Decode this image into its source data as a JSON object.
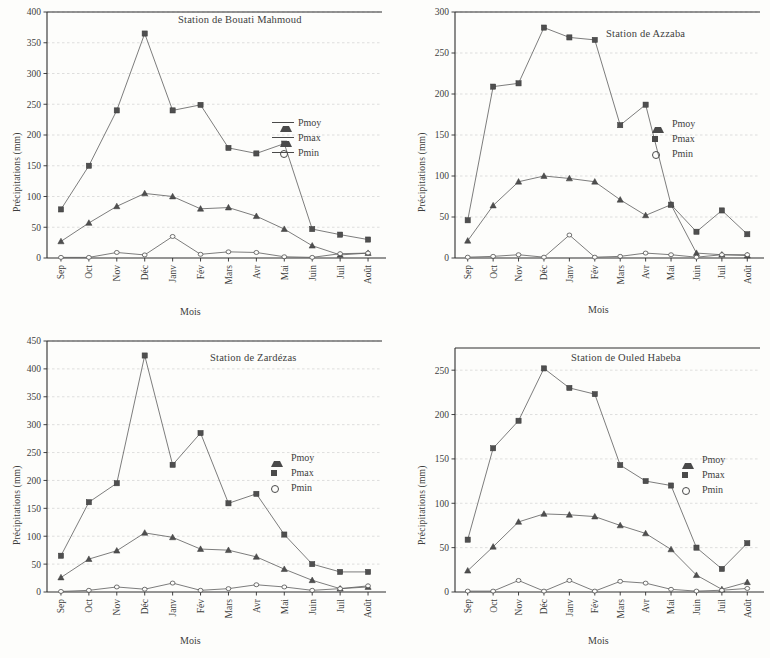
{
  "figure": {
    "background_color": "#fdfdfb",
    "ink_color": "#3d3d3d",
    "grid_color": "#c9c9c9"
  },
  "common": {
    "xlabel": "Mois",
    "ylabel": "Précipitations (mm)",
    "months": [
      "Sep",
      "Oct",
      "Nov",
      "Déc",
      "Janv",
      "Fév",
      "Mars",
      "Avr",
      "Mai",
      "Juin",
      "Juil",
      "Août"
    ],
    "legend": {
      "pmoy": "Pmoy",
      "pmax": "Pmax",
      "pmin": "Pmin"
    }
  },
  "chart_data": [
    {
      "id": "bouati-mahmoud",
      "type": "line",
      "title": "Station de Bouati Mahmoud",
      "xlabel": "Mois",
      "ylabel": "Précipitations (mm)",
      "categories": [
        "Sep",
        "Oct",
        "Nov",
        "Déc",
        "Janv",
        "Fév",
        "Mars",
        "Avr",
        "Mai",
        "Juin",
        "Juil",
        "Août"
      ],
      "ylim": [
        0,
        400
      ],
      "yticks": [
        0,
        50,
        100,
        150,
        200,
        250,
        300,
        350,
        400
      ],
      "grid": true,
      "legend_position": "right-middle",
      "series": [
        {
          "name": "Pmoy",
          "marker": "triangle",
          "values": [
            27,
            57,
            84,
            105,
            100,
            80,
            82,
            68,
            47,
            20,
            5,
            8
          ]
        },
        {
          "name": "Pmax",
          "marker": "square",
          "values": [
            79,
            150,
            240,
            365,
            240,
            249,
            179,
            170,
            186,
            47,
            38,
            30
          ]
        },
        {
          "name": "Pmin",
          "marker": "circle",
          "values": [
            1,
            1,
            9,
            5,
            35,
            6,
            10,
            9,
            2,
            1,
            7,
            8
          ]
        }
      ]
    },
    {
      "id": "azzaba",
      "type": "line",
      "title": "Station de Azzaba",
      "xlabel": "Mois",
      "ylabel": "Précipitations (mm)",
      "categories": [
        "Sep",
        "Oct",
        "Nov",
        "Déc",
        "Janv",
        "Fév",
        "Mars",
        "Avr",
        "Mai",
        "Juin",
        "Juil",
        "Août"
      ],
      "ylim": [
        0,
        300
      ],
      "yticks": [
        0,
        50,
        100,
        150,
        200,
        250,
        300
      ],
      "grid": true,
      "legend_position": "right-middle",
      "series": [
        {
          "name": "Pmoy",
          "marker": "triangle",
          "values": [
            21,
            64,
            93,
            100,
            97,
            93,
            71,
            52,
            65,
            6,
            4,
            3
          ]
        },
        {
          "name": "Pmax",
          "marker": "square",
          "values": [
            46,
            209,
            213,
            281,
            269,
            266,
            162,
            187,
            65,
            32,
            58,
            29
          ]
        },
        {
          "name": "Pmin",
          "marker": "circle",
          "values": [
            1,
            2,
            4,
            1,
            28,
            1,
            2,
            6,
            4,
            1,
            4,
            4
          ]
        }
      ]
    },
    {
      "id": "zardezas",
      "type": "line",
      "title": "Station de Zardézas",
      "xlabel": "Mois",
      "ylabel": "Précipitations (mm)",
      "categories": [
        "Sep",
        "Oct",
        "Nov",
        "Déc",
        "Janv",
        "Fév",
        "Mars",
        "Avr",
        "Mai",
        "Juin",
        "Juil",
        "Août"
      ],
      "ylim": [
        0,
        450
      ],
      "yticks": [
        0,
        50,
        100,
        150,
        200,
        250,
        300,
        350,
        400,
        450
      ],
      "grid": true,
      "legend_position": "right-middle",
      "series": [
        {
          "name": "Pmoy",
          "marker": "triangle",
          "values": [
            26,
            59,
            74,
            106,
            98,
            77,
            75,
            63,
            41,
            21,
            6,
            9
          ]
        },
        {
          "name": "Pmax",
          "marker": "square",
          "values": [
            65,
            161,
            195,
            424,
            228,
            285,
            159,
            176,
            103,
            50,
            36,
            36
          ]
        },
        {
          "name": "Pmin",
          "marker": "circle",
          "values": [
            1,
            3,
            9,
            5,
            16,
            3,
            6,
            13,
            9,
            3,
            6,
            11
          ]
        }
      ]
    },
    {
      "id": "ouled-habeba",
      "type": "line",
      "title": "Station de Ouled Habeba",
      "xlabel": "Mois",
      "ylabel": "Précipitations (mm)",
      "categories": [
        "Sep",
        "Oct",
        "Nov",
        "Déc",
        "Janv",
        "Fév",
        "Mars",
        "Avr",
        "Mai",
        "Juin",
        "Juil",
        "Août"
      ],
      "ylim": [
        0,
        275
      ],
      "yticks": [
        0,
        50,
        100,
        150,
        200,
        250
      ],
      "grid": true,
      "legend_position": "right-middle",
      "series": [
        {
          "name": "Pmoy",
          "marker": "triangle",
          "values": [
            24,
            51,
            79,
            88,
            87,
            85,
            75,
            66,
            48,
            19,
            3,
            11
          ]
        },
        {
          "name": "Pmax",
          "marker": "square",
          "values": [
            59,
            162,
            193,
            252,
            230,
            223,
            143,
            125,
            120,
            50,
            26,
            55
          ]
        },
        {
          "name": "Pmin",
          "marker": "circle",
          "values": [
            1,
            1,
            13,
            1,
            13,
            1,
            12,
            10,
            3,
            1,
            2,
            4
          ]
        }
      ]
    }
  ]
}
